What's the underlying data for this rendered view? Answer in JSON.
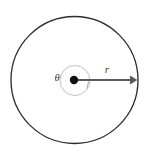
{
  "figure": {
    "background_color": "#ffffff",
    "width": 148,
    "height": 157
  },
  "labels": {
    "angle_symbol": "θ",
    "radius_symbol": "r"
  },
  "colors": {
    "outer_circle_stroke": "#2b2b2b",
    "inner_circle_stroke": "#b9b9b9",
    "center_dot_fill": "#111111",
    "radius_arrow_stroke": "#5a5a5a",
    "label_text": "#3a3a3a",
    "tick_mark_stroke": "#9a9a9a"
  },
  "chart_data": {
    "type": "diagram",
    "subtype": "geometry-circle",
    "elements": [
      {
        "name": "outer-circle",
        "shape": "circle",
        "cx": 74.5,
        "cy": 80,
        "r": 63.5,
        "stroke": "#2b2b2b",
        "stroke_width": 1.3,
        "fill": "none"
      },
      {
        "name": "inner-angle-arc-circle",
        "shape": "circle",
        "cx": 75,
        "cy": 80.5,
        "r": 15,
        "stroke": "#b9b9b9",
        "stroke_width": 0.9,
        "fill": "none"
      },
      {
        "name": "center-dot",
        "shape": "circle",
        "cx": 74,
        "cy": 80,
        "r": 4.2,
        "fill": "#111111"
      },
      {
        "name": "radius-arrow",
        "shape": "arrow",
        "x1": 74,
        "y1": 80,
        "x2": 137,
        "y2": 80,
        "stroke": "#5a5a5a",
        "stroke_width": 2.1
      },
      {
        "name": "angle-tick-mark",
        "shape": "line",
        "x1": 88.5,
        "y1": 82,
        "x2": 87,
        "y2": 88,
        "stroke": "#9a9a9a",
        "stroke_width": 0.9
      }
    ],
    "annotations": [
      {
        "name": "angle-label",
        "text": "θ",
        "x": 57,
        "y": 79,
        "font_size": 10.5,
        "italic": true
      },
      {
        "name": "radius-label",
        "text": "r",
        "x": 107,
        "y": 70,
        "font_size": 11,
        "italic": true
      }
    ]
  }
}
